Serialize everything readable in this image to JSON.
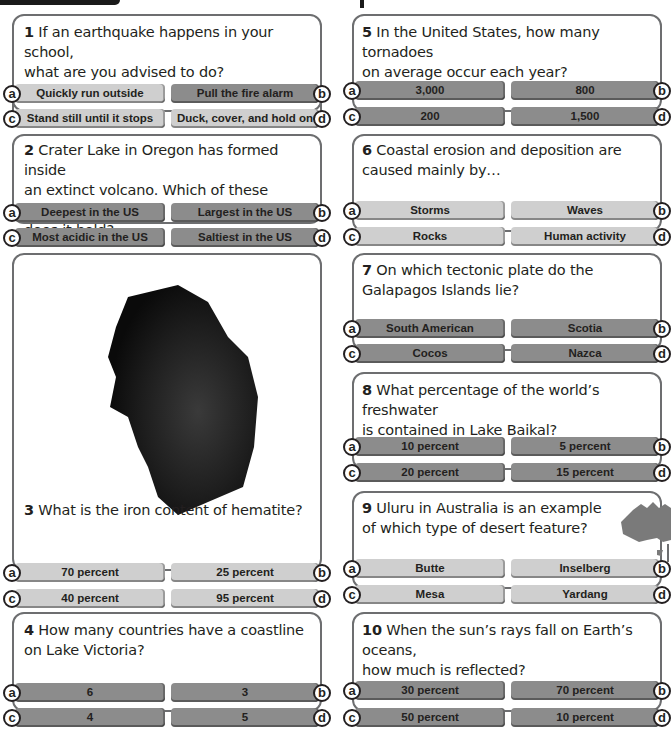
{
  "questions": [
    {
      "number": "1",
      "text": "If an earthquake happens in your school, what are you advised to do?",
      "line1": "If an earthquake happens in your school,",
      "line2": "what are you advised to do?",
      "options": {
        "a": "Quickly run outside",
        "b": "Pull the fire alarm",
        "c": "Stand still until it stops",
        "d": "Duck, cover, and hold on"
      }
    },
    {
      "number": "2",
      "text": "Crater Lake in Oregon has formed inside an extinct volcano. Which of these records does it hold?",
      "line1": "Crater Lake in Oregon has formed inside",
      "line2": "an extinct volcano. Which of these records",
      "line3": "does it hold?",
      "options": {
        "a": "Deepest in the US",
        "b": "Largest in the US",
        "c": "Most acidic in the US",
        "d": "Saltiest in the US"
      }
    },
    {
      "number": "3",
      "text": "What is the iron content of hematite?",
      "image": "hematite-rock",
      "options": {
        "a": "70 percent",
        "b": "25 percent",
        "c": "40 percent",
        "d": "95 percent"
      }
    },
    {
      "number": "4",
      "text": "How many countries have a coastline on Lake Victoria?",
      "line1": "How many countries have a coastline",
      "line2": "on Lake Victoria?",
      "options": {
        "a": "6",
        "b": "3",
        "c": "4",
        "d": "5"
      }
    },
    {
      "number": "5",
      "text": "In the United States, how many tornadoes on average occur each year?",
      "line1": "In the United States, how many tornadoes",
      "line2": "on average occur each year?",
      "options": {
        "a": "3,000",
        "b": "800",
        "c": "200",
        "d": "1,500"
      }
    },
    {
      "number": "6",
      "text": "Coastal erosion and deposition are caused mainly by…",
      "line1": "Coastal erosion and deposition are",
      "line2": "caused mainly by…",
      "options": {
        "a": "Storms",
        "b": "Waves",
        "c": "Rocks",
        "d": "Human activity"
      }
    },
    {
      "number": "7",
      "text": "On which tectonic plate do the Galapagos Islands lie?",
      "line1": "On which tectonic plate do the",
      "line2": "Galapagos Islands lie?",
      "options": {
        "a": "South American",
        "b": "Scotia",
        "c": "Cocos",
        "d": "Nazca"
      }
    },
    {
      "number": "8",
      "text": "What percentage of the world's freshwater is contained in Lake Baikal?",
      "line1": "What percentage of the world’s freshwater",
      "line2": "is contained in Lake Baikal?",
      "options": {
        "a": "10 percent",
        "b": "5 percent",
        "c": "20 percent",
        "d": "15 percent"
      }
    },
    {
      "number": "9",
      "text": "Uluru in Australia is an example of which type of desert feature?",
      "line1": "Uluru in Australia is an example",
      "line2": "of which type of desert feature?",
      "image": "australia-map",
      "options": {
        "a": "Butte",
        "b": "Inselberg",
        "c": "Mesa",
        "d": "Yardang"
      }
    },
    {
      "number": "10",
      "text": "When the sun's rays fall on Earth's oceans, how much is reflected?",
      "line1": "When the sun’s rays fall on Earth’s oceans,",
      "line2": "how much is reflected?",
      "options": {
        "a": "30 percent",
        "b": "70 percent",
        "c": "50 percent",
        "d": "10 percent"
      }
    }
  ],
  "letters": {
    "a": "a",
    "b": "b",
    "c": "c",
    "d": "d"
  },
  "colors": {
    "option_dark": "#8c8c8c",
    "option_light": "#cfcfcf",
    "border": "#6d6e70",
    "text": "#231f20"
  }
}
